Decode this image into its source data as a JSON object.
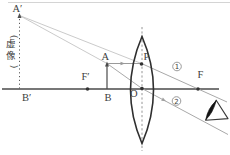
{
  "figure": {
    "background": "#ffffff",
    "colors": {
      "axis": "#4a4a4a",
      "lens": "#2f2f2f",
      "object": "#4a4a4a",
      "ray": "#9a9a9a",
      "extension": "#c4c4c4",
      "dashed": "#8a8a8a",
      "dotted": "#5a5a5a",
      "dot": "#333333",
      "label": "#3d3d3d",
      "badge": "#8f8f8f",
      "top_rule": "#c9c9c9",
      "eye_stroke": "#3a3a3a",
      "eye_pupil": "#141414"
    },
    "labels": [
      {
        "name": "label-image-top",
        "text": "A′",
        "x": 12.5,
        "y": 12,
        "size": 10.5
      },
      {
        "name": "label-virtual-image",
        "text": "(虚像)",
        "x": 10.5,
        "y": 36.5,
        "size": 9.5,
        "vertical": true
      },
      {
        "name": "label-image-bottom",
        "text": "B′",
        "x": 22,
        "y": 101,
        "size": 10.5
      },
      {
        "name": "label-left-focus",
        "text": "F′",
        "x": 81.5,
        "y": 80,
        "size": 10.5
      },
      {
        "name": "label-object-top",
        "text": "A",
        "x": 101.5,
        "y": 60,
        "size": 10.5
      },
      {
        "name": "label-object-bottom",
        "text": "B",
        "x": 104.5,
        "y": 101,
        "size": 10.5
      },
      {
        "name": "label-optical-center",
        "text": "O",
        "x": 130,
        "y": 97,
        "size": 10.5
      },
      {
        "name": "label-point-p",
        "text": "P",
        "x": 143.5,
        "y": 60,
        "size": 10.5
      },
      {
        "name": "label-right-focus",
        "text": "F",
        "x": 197.5,
        "y": 78,
        "size": 10.5
      }
    ],
    "badges": [
      {
        "name": "ray-1-badge",
        "text": "1",
        "cx": 177,
        "cy": 66.5,
        "r": 4.3
      },
      {
        "name": "ray-2-badge",
        "text": "2",
        "cx": 176.5,
        "cy": 101,
        "r": 4.3
      }
    ],
    "lines": [
      {
        "name": "top-rule",
        "x1": 8,
        "y1": 2.5,
        "x2": 230,
        "y2": 2.5,
        "color": "#c9c9c9",
        "w": 0.8
      },
      {
        "name": "principal-axis",
        "x1": 2,
        "y1": 89,
        "x2": 219,
        "y2": 89,
        "color": "#4a4a4a",
        "w": 1.4
      },
      {
        "name": "lens-axis-dashed",
        "x1": 142,
        "y1": 27,
        "x2": 142,
        "y2": 151,
        "color": "#8a8a8a",
        "w": 0.9,
        "dash": "2.2,2.2"
      },
      {
        "name": "virtual-image-line",
        "x1": 19.5,
        "y1": 19,
        "x2": 19.5,
        "y2": 88.5,
        "color": "#5a5a5a",
        "w": 1,
        "dash": "1.2,2.6"
      },
      {
        "name": "extension-to-p",
        "x1": 19.5,
        "y1": 15.5,
        "x2": 141.5,
        "y2": 63.5,
        "color": "#c4c4c4",
        "w": 0.9
      },
      {
        "name": "extension-to-a",
        "x1": 19.5,
        "y1": 15.5,
        "x2": 107,
        "y2": 63.5,
        "color": "#c4c4c4",
        "w": 0.9
      },
      {
        "name": "object-arrow-shaft",
        "x1": 107,
        "y1": 89,
        "x2": 107,
        "y2": 65.5,
        "color": "#4a4a4a",
        "w": 1.2
      },
      {
        "name": "ray-1-incident",
        "x1": 107,
        "y1": 63.5,
        "x2": 141.5,
        "y2": 63.5,
        "color": "#9a9a9a",
        "w": 1
      },
      {
        "name": "ray-1-refracted",
        "x1": 141.5,
        "y1": 63.5,
        "x2": 227,
        "y2": 102,
        "color": "#a9a9a9",
        "w": 1
      },
      {
        "name": "ray-2-incident",
        "x1": 107,
        "y1": 63.5,
        "x2": 142,
        "y2": 88.5,
        "color": "#a9a9a9",
        "w": 1
      },
      {
        "name": "ray-2-refracted",
        "x1": 142,
        "y1": 88.5,
        "x2": 228,
        "y2": 134.5,
        "color": "#a9a9a9",
        "w": 1
      }
    ],
    "arrowheads": [
      {
        "name": "virtual-image-arrowhead",
        "x": 19.5,
        "y": 13,
        "angle": -90,
        "len": 5,
        "hw": 2,
        "color": "#4f4f4f"
      },
      {
        "name": "object-arrowhead",
        "x": 107,
        "y": 61.5,
        "angle": -90,
        "len": 5,
        "hw": 2,
        "color": "#4a4a4a"
      },
      {
        "name": "ray-1-direction-arrow",
        "x": 125,
        "y": 63.5,
        "angle": 0,
        "len": 4.5,
        "hw": 1.8,
        "color": "#999999"
      },
      {
        "name": "ray-2-direction-arrow",
        "x": 166,
        "y": 101.3,
        "angle": 28.2,
        "len": 4.5,
        "hw": 1.8,
        "color": "#a0a0a0"
      }
    ],
    "dots": [
      {
        "name": "left-focus-dot",
        "cx": 87.5,
        "cy": 89,
        "r": 1.8
      },
      {
        "name": "right-focus-dot",
        "cx": 198,
        "cy": 89,
        "r": 1.8
      },
      {
        "name": "optical-center-dot",
        "cx": 142,
        "cy": 88.5,
        "r": 1.8
      },
      {
        "name": "point-p-dot",
        "cx": 141.5,
        "cy": 64,
        "r": 1.8
      }
    ],
    "lens": {
      "cx": 142,
      "cy": 90,
      "rx": 11.5,
      "ry": 53.5,
      "stroke_w": 1.6
    },
    "eye": {
      "triangle": "216.2,100.2 205.6,120.2 228,118.6",
      "pupil": "M216.2,100.6 Q207.6,108.6 205.8,119.6 Q213,113.2 216.2,100.6 Z"
    }
  }
}
